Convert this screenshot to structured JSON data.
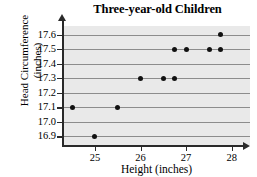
{
  "chart_data": {
    "type": "scatter",
    "title": "Three-year-old Children",
    "xlabel": "Height (inches)",
    "ylabel": "Head Circumference (inches)",
    "ylabel_lines": [
      "Head Circumference",
      "(inches)"
    ],
    "xlim": [
      24.3,
      28.4
    ],
    "ylim": [
      16.84,
      17.66
    ],
    "grid": true,
    "grid_orientation": "horizontal",
    "legend": "none",
    "xticks": [
      25,
      26,
      27,
      28
    ],
    "xticklabels": [
      "25",
      "26",
      "27",
      "28"
    ],
    "yticks": [
      16.9,
      17.0,
      17.1,
      17.2,
      17.3,
      17.4,
      17.5,
      17.6
    ],
    "yticklabels": [
      "16.9",
      "17.0",
      "17.1",
      "17.2",
      "17.3",
      "17.4",
      "17.5",
      "17.6"
    ],
    "x": [
      24.5,
      25.0,
      25.5,
      26.0,
      26.5,
      26.75,
      26.75,
      27.0,
      27.5,
      27.75,
      27.75
    ],
    "y": [
      17.1,
      16.9,
      17.1,
      17.3,
      17.3,
      17.3,
      17.5,
      17.5,
      17.5,
      17.5,
      17.6
    ],
    "points": [
      {
        "x": 24.5,
        "y": 17.1
      },
      {
        "x": 25.0,
        "y": 16.9
      },
      {
        "x": 25.5,
        "y": 17.1
      },
      {
        "x": 26.0,
        "y": 17.3
      },
      {
        "x": 26.5,
        "y": 17.3
      },
      {
        "x": 26.75,
        "y": 17.3
      },
      {
        "x": 26.75,
        "y": 17.5
      },
      {
        "x": 27.0,
        "y": 17.5
      },
      {
        "x": 27.5,
        "y": 17.5
      },
      {
        "x": 27.75,
        "y": 17.5
      },
      {
        "x": 27.75,
        "y": 17.6
      }
    ],
    "n_points": 11,
    "colors": {
      "point": "#111111",
      "gridline": "#8c8c8c",
      "plot_background": "#e9e9e9",
      "axis": "#2a2a2a",
      "text": "#000000",
      "page_background": "#ffffff"
    }
  }
}
